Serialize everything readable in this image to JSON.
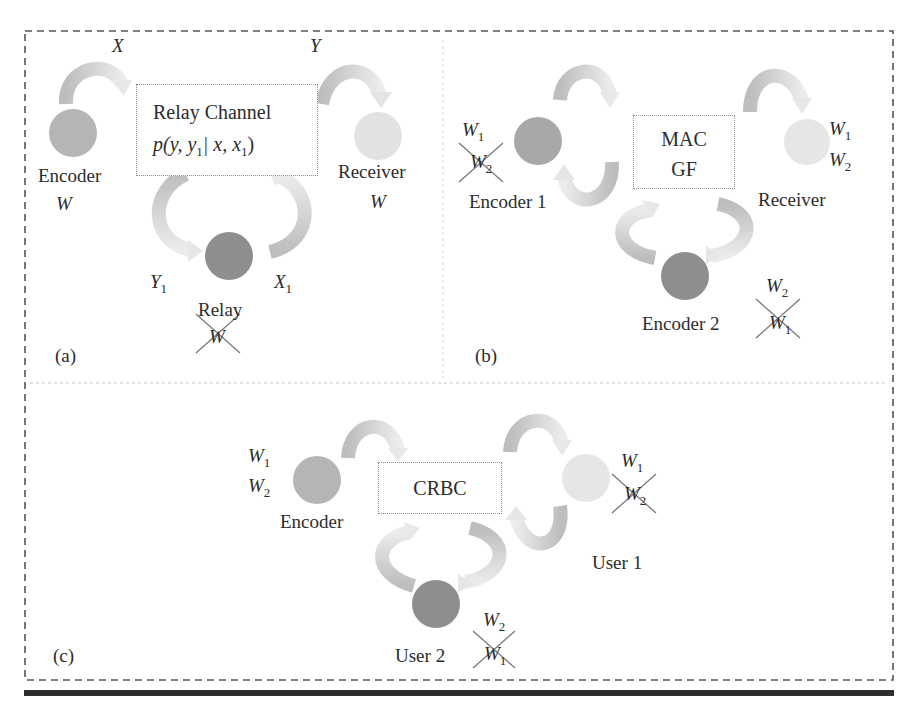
{
  "figure": {
    "panels": [
      {
        "tag": "(a)",
        "channel_box": {
          "title": "Relay Channel",
          "formula": "p(y, y1| x, x1)",
          "formula_parts": {
            "p": "p(",
            "y": "y, y",
            "y_sub": "1",
            "bar": "| x, x",
            "x_sub": "1",
            "close": ")"
          }
        },
        "nodes": {
          "encoder": {
            "label": "Encoder",
            "message": "W"
          },
          "receiver": {
            "label": "Receiver",
            "message": "W"
          },
          "relay": {
            "label": "Relay",
            "message_crossed": "W"
          }
        },
        "signals": {
          "x": "X",
          "y": "Y",
          "y1": "Y",
          "y1_sub": "1",
          "x1": "X",
          "x1_sub": "1"
        }
      },
      {
        "tag": "(b)",
        "channel_box": {
          "line1": "MAC",
          "line2": "GF"
        },
        "nodes": {
          "encoder1": {
            "label": "Encoder 1",
            "msg_kept": "W",
            "msg_kept_sub": "1",
            "msg_crossed": "W",
            "msg_crossed_sub": "2"
          },
          "receiver": {
            "label": "Receiver",
            "msg1": "W",
            "msg1_sub": "1",
            "msg2": "W",
            "msg2_sub": "2"
          },
          "encoder2": {
            "label": "Encoder 2",
            "msg_kept": "W",
            "msg_kept_sub": "2",
            "msg_crossed": "W",
            "msg_crossed_sub": "1"
          }
        }
      },
      {
        "tag": "(c)",
        "channel_box": {
          "title": "CRBC"
        },
        "nodes": {
          "encoder": {
            "label": "Encoder",
            "msg1": "W",
            "msg1_sub": "1",
            "msg2": "W",
            "msg2_sub": "2"
          },
          "user1": {
            "label": "User 1",
            "msg_kept": "W",
            "msg_kept_sub": "1",
            "msg_crossed": "W",
            "msg_crossed_sub": "2"
          },
          "user2": {
            "label": "User 2",
            "msg_kept": "W",
            "msg_kept_sub": "2",
            "msg_crossed": "W",
            "msg_crossed_sub": "1"
          }
        }
      }
    ],
    "colors": {
      "node_dark": "#8c8c8c",
      "node_mid": "#b8b8b8",
      "node_light": "#dedede",
      "arrow_dark": "#bdbdbd",
      "arrow_light": "#e6e6e6",
      "border": "#555555",
      "cross": "#7a7a7a",
      "bar": "#2e2e2e"
    }
  }
}
